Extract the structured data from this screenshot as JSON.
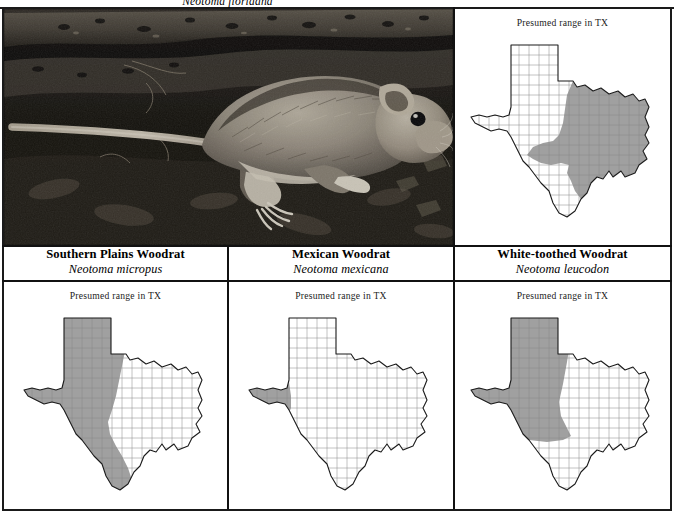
{
  "plate": {
    "top_species_scientific": "Neotoma floridana",
    "map_title": "Presumed range in TX",
    "shade_color": "#a0a0a0",
    "outline_color": "#1a1a1a",
    "county_color": "#8a8a8a",
    "frame_color": "#1a1a1a",
    "background": "#ffffff"
  },
  "photo": {
    "alt_name": "woodrat-photograph",
    "subject": "woodrat",
    "palette": {
      "ground_dark": "#111111",
      "ground_mid": "#3a3631",
      "fur_light": "#b9b2a4",
      "fur_mid": "#8c8477",
      "tail": "#cfc8ba",
      "eye": "#060606"
    }
  },
  "cells": [
    {
      "id": "cell-tr",
      "position": "top-right",
      "map_title": "Presumed range in TX",
      "range_region": "eastern Texas and the upper Gulf coast",
      "species_common": "Eastern Woodrat",
      "species_scientific": "Neotoma floridana"
    },
    {
      "id": "cell-bl",
      "position": "bottom-left",
      "map_title": "Presumed range in TX",
      "range_region": "Panhandle, western, central and south Texas",
      "species_common": "Southern Plains Woodrat",
      "species_scientific": "Neotoma micropus"
    },
    {
      "id": "cell-bm",
      "position": "bottom-middle",
      "map_title": "Presumed range in TX",
      "range_region": "Trans-Pecos far west Texas",
      "species_common": "Mexican Woodrat",
      "species_scientific": "Neotoma mexicana"
    },
    {
      "id": "cell-br",
      "position": "bottom-right",
      "map_title": "Presumed range in TX",
      "range_region": "Panhandle and west-central Texas",
      "species_common": "White-toothed Woodrat",
      "species_scientific": "Neotoma leucodon"
    }
  ],
  "captions": [
    {
      "common": "Southern Plains Woodrat",
      "scientific": "Neotoma micropus"
    },
    {
      "common": "Mexican Woodrat",
      "scientific": "Neotoma mexicana"
    },
    {
      "common": "White-toothed Woodrat",
      "scientific": "Neotoma leucodon"
    }
  ]
}
